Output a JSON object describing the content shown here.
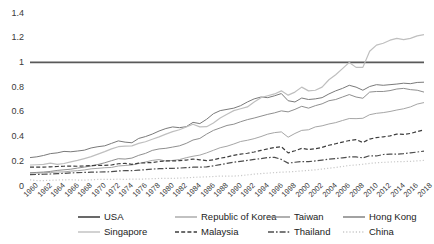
{
  "chart_data": {
    "type": "line",
    "title": "",
    "xlabel": "",
    "ylabel": "",
    "xlim": [
      1960,
      2018
    ],
    "ylim": [
      0,
      1.4
    ],
    "yticks": [
      "0",
      "0.2",
      "0.4",
      "0.6",
      "0.8",
      "1",
      "1.2",
      "1.4"
    ],
    "ytick_values": [
      0,
      0.2,
      0.4,
      0.6,
      0.8,
      1.0,
      1.2,
      1.4
    ],
    "grid": false,
    "legend_position": "bottom",
    "x": [
      1960,
      1961,
      1962,
      1963,
      1964,
      1965,
      1966,
      1967,
      1968,
      1969,
      1970,
      1971,
      1972,
      1973,
      1974,
      1975,
      1976,
      1977,
      1978,
      1979,
      1980,
      1981,
      1982,
      1983,
      1984,
      1985,
      1986,
      1987,
      1988,
      1989,
      1990,
      1991,
      1992,
      1993,
      1994,
      1995,
      1996,
      1997,
      1998,
      1999,
      2000,
      2001,
      2002,
      2003,
      2004,
      2005,
      2006,
      2007,
      2008,
      2009,
      2010,
      2011,
      2012,
      2013,
      2014,
      2015,
      2016,
      2017,
      2018
    ],
    "xtick_labels": [
      "1960",
      "1962",
      "1964",
      "1966",
      "1968",
      "1970",
      "1972",
      "1974",
      "1976",
      "1978",
      "1980",
      "1982",
      "1984",
      "1986",
      "1988",
      "1990",
      "1992",
      "1994",
      "1996",
      "1998",
      "2000",
      "2002",
      "2004",
      "2006",
      "2008",
      "2010",
      "2012",
      "2014",
      "2016",
      "2018"
    ],
    "series": [
      {
        "name": "USA",
        "style": "solid",
        "color": "#595959",
        "width": 1.8,
        "values": [
          1,
          1,
          1,
          1,
          1,
          1,
          1,
          1,
          1,
          1,
          1,
          1,
          1,
          1,
          1,
          1,
          1,
          1,
          1,
          1,
          1,
          1,
          1,
          1,
          1,
          1,
          1,
          1,
          1,
          1,
          1,
          1,
          1,
          1,
          1,
          1,
          1,
          1,
          1,
          1,
          1,
          1,
          1,
          1,
          1,
          1,
          1,
          1,
          1,
          1,
          1,
          1,
          1,
          1,
          1,
          1,
          1,
          1,
          1
        ]
      },
      {
        "name": "Republic of Korea",
        "style": "solid",
        "color": "#a6a6a6",
        "width": 1.0,
        "values": [
          0.105,
          0.105,
          0.106,
          0.11,
          0.113,
          0.114,
          0.12,
          0.124,
          0.13,
          0.139,
          0.143,
          0.148,
          0.15,
          0.162,
          0.166,
          0.17,
          0.182,
          0.194,
          0.207,
          0.214,
          0.202,
          0.207,
          0.214,
          0.229,
          0.241,
          0.25,
          0.268,
          0.289,
          0.31,
          0.322,
          0.34,
          0.36,
          0.37,
          0.383,
          0.4,
          0.42,
          0.432,
          0.438,
          0.395,
          0.425,
          0.45,
          0.455,
          0.478,
          0.487,
          0.502,
          0.513,
          0.53,
          0.546,
          0.545,
          0.548,
          0.577,
          0.588,
          0.594,
          0.603,
          0.615,
          0.625,
          0.64,
          0.663,
          0.675
        ]
      },
      {
        "name": "Taiwan",
        "style": "solid",
        "color": "#8f8f8f",
        "width": 1.0,
        "values": [
          0.107,
          0.11,
          0.113,
          0.118,
          0.126,
          0.131,
          0.136,
          0.145,
          0.153,
          0.162,
          0.174,
          0.188,
          0.205,
          0.221,
          0.218,
          0.226,
          0.248,
          0.264,
          0.288,
          0.3,
          0.305,
          0.315,
          0.325,
          0.345,
          0.372,
          0.385,
          0.42,
          0.45,
          0.47,
          0.49,
          0.5,
          0.52,
          0.537,
          0.55,
          0.565,
          0.58,
          0.592,
          0.608,
          0.6,
          0.62,
          0.645,
          0.63,
          0.65,
          0.665,
          0.69,
          0.7,
          0.72,
          0.74,
          0.72,
          0.71,
          0.76,
          0.765,
          0.765,
          0.772,
          0.785,
          0.79,
          0.78,
          0.775,
          0.76
        ]
      },
      {
        "name": "Hong Kong",
        "style": "solid",
        "color": "#7a7a7a",
        "width": 1.0,
        "values": [
          0.23,
          0.236,
          0.247,
          0.262,
          0.268,
          0.28,
          0.277,
          0.283,
          0.29,
          0.308,
          0.318,
          0.325,
          0.345,
          0.365,
          0.355,
          0.35,
          0.385,
          0.4,
          0.42,
          0.445,
          0.465,
          0.478,
          0.472,
          0.48,
          0.515,
          0.505,
          0.54,
          0.585,
          0.61,
          0.62,
          0.63,
          0.65,
          0.68,
          0.705,
          0.72,
          0.715,
          0.73,
          0.748,
          0.69,
          0.68,
          0.712,
          0.7,
          0.705,
          0.715,
          0.745,
          0.77,
          0.79,
          0.815,
          0.8,
          0.775,
          0.805,
          0.82,
          0.815,
          0.82,
          0.825,
          0.832,
          0.828,
          0.838,
          0.84
        ]
      },
      {
        "name": "Singapore",
        "style": "solid",
        "color": "#bfbfbf",
        "width": 1.2,
        "values": [
          0.17,
          0.172,
          0.175,
          0.185,
          0.175,
          0.182,
          0.195,
          0.207,
          0.222,
          0.238,
          0.258,
          0.278,
          0.3,
          0.318,
          0.322,
          0.325,
          0.345,
          0.358,
          0.378,
          0.398,
          0.42,
          0.44,
          0.455,
          0.478,
          0.5,
          0.478,
          0.48,
          0.51,
          0.55,
          0.58,
          0.61,
          0.625,
          0.64,
          0.68,
          0.715,
          0.73,
          0.745,
          0.77,
          0.735,
          0.76,
          0.8,
          0.77,
          0.775,
          0.8,
          0.86,
          0.9,
          0.95,
          1.0,
          0.96,
          0.96,
          1.09,
          1.14,
          1.155,
          1.18,
          1.195,
          1.185,
          1.195,
          1.215,
          1.225
        ]
      },
      {
        "name": "Malaysia",
        "style": "dashed",
        "color": "#3d3d3d",
        "width": 1.2,
        "values": [
          0.152,
          0.152,
          0.153,
          0.155,
          0.158,
          0.16,
          0.161,
          0.16,
          0.162,
          0.165,
          0.167,
          0.167,
          0.17,
          0.18,
          0.183,
          0.175,
          0.185,
          0.188,
          0.19,
          0.198,
          0.203,
          0.203,
          0.205,
          0.21,
          0.218,
          0.212,
          0.205,
          0.212,
          0.225,
          0.235,
          0.248,
          0.258,
          0.265,
          0.275,
          0.288,
          0.3,
          0.312,
          0.318,
          0.268,
          0.285,
          0.305,
          0.295,
          0.302,
          0.312,
          0.33,
          0.342,
          0.355,
          0.368,
          0.375,
          0.352,
          0.38,
          0.392,
          0.398,
          0.405,
          0.42,
          0.418,
          0.425,
          0.44,
          0.455
        ]
      },
      {
        "name": "Thailand",
        "style": "dashdot",
        "color": "#4d4d4d",
        "width": 1.2,
        "values": [
          0.092,
          0.093,
          0.095,
          0.097,
          0.1,
          0.102,
          0.106,
          0.108,
          0.11,
          0.112,
          0.113,
          0.114,
          0.116,
          0.122,
          0.124,
          0.124,
          0.128,
          0.132,
          0.137,
          0.14,
          0.142,
          0.143,
          0.145,
          0.148,
          0.152,
          0.152,
          0.155,
          0.163,
          0.173,
          0.183,
          0.193,
          0.2,
          0.207,
          0.215,
          0.222,
          0.23,
          0.232,
          0.215,
          0.185,
          0.192,
          0.198,
          0.197,
          0.203,
          0.21,
          0.218,
          0.222,
          0.228,
          0.235,
          0.235,
          0.228,
          0.245,
          0.243,
          0.255,
          0.258,
          0.258,
          0.262,
          0.268,
          0.275,
          0.282
        ]
      },
      {
        "name": "China",
        "style": "dotted",
        "color": "#c9c9c9",
        "width": 1.2,
        "values": [
          0.05,
          0.044,
          0.044,
          0.046,
          0.048,
          0.05,
          0.051,
          0.048,
          0.047,
          0.05,
          0.053,
          0.054,
          0.054,
          0.055,
          0.054,
          0.056,
          0.055,
          0.057,
          0.059,
          0.061,
          0.062,
          0.062,
          0.064,
          0.066,
          0.07,
          0.072,
          0.074,
          0.077,
          0.08,
          0.08,
          0.08,
          0.084,
          0.09,
          0.096,
          0.1,
          0.104,
          0.108,
          0.112,
          0.114,
          0.117,
          0.122,
          0.126,
          0.131,
          0.137,
          0.144,
          0.15,
          0.158,
          0.166,
          0.17,
          0.176,
          0.183,
          0.188,
          0.191,
          0.194,
          0.197,
          0.198,
          0.2,
          0.203,
          0.207
        ]
      }
    ]
  },
  "legend": {
    "items": [
      {
        "label": "USA",
        "swatch": "legend-swatch-usa"
      },
      {
        "label": "Republic of Korea",
        "swatch": "legend-swatch-korea"
      },
      {
        "label": "Taiwan",
        "swatch": "legend-swatch-taiwan"
      },
      {
        "label": "Hong Kong",
        "swatch": "legend-swatch-hongkong"
      },
      {
        "label": "Singapore",
        "swatch": "legend-swatch-singapore"
      },
      {
        "label": "Malaysia",
        "swatch": "legend-swatch-malaysia"
      },
      {
        "label": "Thailand",
        "swatch": "legend-swatch-thailand"
      },
      {
        "label": "China",
        "swatch": "legend-swatch-china"
      }
    ]
  }
}
